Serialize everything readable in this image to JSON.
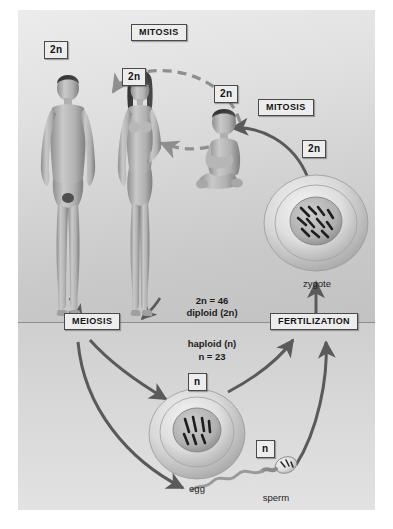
{
  "diagram": {
    "zones": {
      "diploid_label": "diploid (2n)",
      "diploid_count": "2n = 46",
      "haploid_label": "haploid (n)",
      "haploid_count": "n = 23"
    },
    "stages": {
      "mitosis_top": "MITOSIS",
      "mitosis_right": "MITOSIS",
      "meiosis": "MEIOSIS",
      "fertilization": "FERTILIZATION"
    },
    "ploidy_tags": {
      "man": "2n",
      "woman": "2n",
      "child": "2n",
      "zygote": "2n",
      "egg": "n",
      "sperm": "n"
    },
    "cells": {
      "zygote": "zygote",
      "egg": "egg",
      "sperm": "sperm"
    },
    "organisms": {
      "man": "adult male",
      "woman": "adult female",
      "child": "child"
    },
    "colors": {
      "background_upper": "#e4e4e4",
      "background_lower": "#d6d6d6",
      "arrow_solid": "#5a5a5a",
      "arrow_dashed": "#8f8f8f",
      "divider": "#8e8e8e",
      "box_fill": "#ededed",
      "box_border": "#4a4a4a",
      "text": "#141414"
    }
  }
}
